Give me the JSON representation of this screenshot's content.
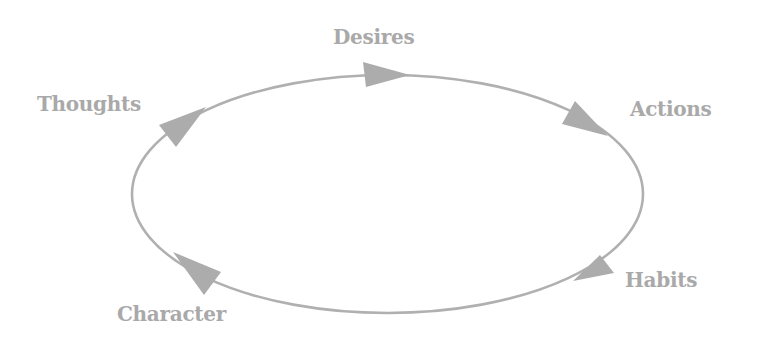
{
  "diagram": {
    "type": "cycle",
    "direction": "clockwise",
    "colors": {
      "line": "#b0b0b0",
      "arrow": "#acacac",
      "text": "#a9a9a9",
      "background": "#ffffff"
    },
    "nodes": [
      {
        "id": "desires",
        "label": "Desires"
      },
      {
        "id": "actions",
        "label": "Actions"
      },
      {
        "id": "habits",
        "label": "Habits"
      },
      {
        "id": "character",
        "label": "Character"
      },
      {
        "id": "thoughts",
        "label": "Thoughts"
      }
    ],
    "edges": [
      {
        "from": "thoughts",
        "to": "desires"
      },
      {
        "from": "desires",
        "to": "actions"
      },
      {
        "from": "actions",
        "to": "habits"
      },
      {
        "from": "habits",
        "to": "character"
      },
      {
        "from": "character",
        "to": "thoughts"
      }
    ]
  }
}
